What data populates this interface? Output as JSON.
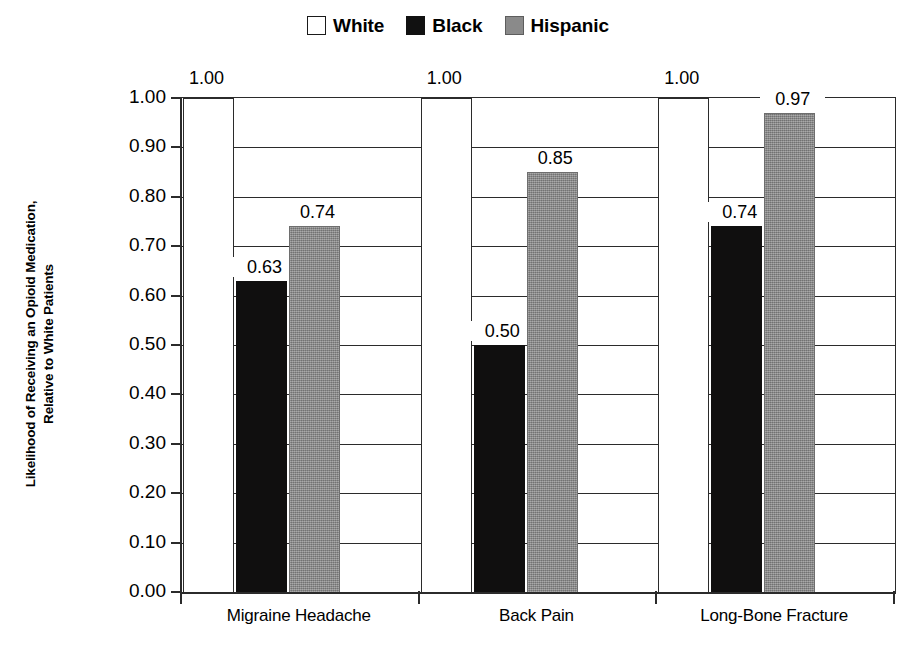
{
  "chart_data": {
    "type": "bar",
    "title": "",
    "xlabel": "",
    "ylabel": "Likelihood of Receiving an Opioid Medication, Relative to White Patients",
    "ylabel_lines": [
      "Likelihood of Receiving an Opioid Medication,",
      "Relative to White Patients"
    ],
    "categories": [
      "Migraine Headache",
      "Back Pain",
      "Long-Bone Fracture"
    ],
    "series": [
      {
        "name": "White",
        "color": "#ffffff",
        "values": [
          1.0,
          1.0,
          1.0
        ],
        "labels": [
          "1.00",
          "1.00",
          "1.00"
        ]
      },
      {
        "name": "Black",
        "color": "#100f0f",
        "values": [
          0.63,
          0.5,
          0.74
        ],
        "labels": [
          "0.63",
          "0.50",
          "0.74"
        ]
      },
      {
        "name": "Hispanic",
        "color": "#8a8a8a",
        "values": [
          0.74,
          0.85,
          0.97
        ],
        "labels": [
          "0.74",
          "0.85",
          "0.97"
        ]
      }
    ],
    "ylim": [
      0.0,
      1.0
    ],
    "ytick_values": [
      1.0,
      0.9,
      0.8,
      0.7,
      0.6,
      0.5,
      0.4,
      0.3,
      0.2,
      0.1,
      0.0
    ],
    "ytick_labels": [
      "1.00",
      "0.90",
      "0.80",
      "0.70",
      "0.60",
      "0.50",
      "0.40",
      "0.30",
      "0.20",
      "0.10",
      "0.00"
    ],
    "grid": true,
    "legend_position": "top-center"
  },
  "legend": {
    "items": [
      {
        "label": "White",
        "swatch": "white-swatch-icon"
      },
      {
        "label": "Black",
        "swatch": "black-swatch-icon"
      },
      {
        "label": "Hispanic",
        "swatch": "gray-swatch-icon"
      }
    ]
  }
}
